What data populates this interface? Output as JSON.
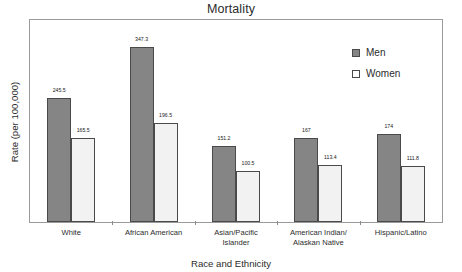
{
  "chart_data": {
    "type": "bar",
    "title": "Mortality",
    "xlabel": "Race and Ethnicity",
    "ylabel": "Rate (per 100,000)",
    "grid": false,
    "legend_position": "upper right",
    "ylim": [
      0,
      400
    ],
    "categories": [
      "White",
      "African American",
      "Asian/Pacific Islander",
      "American Indian/ Alaskan Native",
      "Hispanic/Latino"
    ],
    "category_lines": [
      [
        "White"
      ],
      [
        "African American"
      ],
      [
        "Asian/Pacific",
        "Islander"
      ],
      [
        "American Indian/",
        "Alaskan Native"
      ],
      [
        "Hispanic/Latino"
      ]
    ],
    "series": [
      {
        "name": "Men",
        "color": "#858585",
        "values": [
          245.5,
          347.3,
          151.2,
          167,
          174
        ],
        "labels": [
          "245.5",
          "347.3",
          "151.2",
          "167",
          "174"
        ]
      },
      {
        "name": "Women",
        "color": "#f2f2f2",
        "values": [
          165.5,
          196.5,
          100.5,
          113.4,
          111.8
        ],
        "labels": [
          "165.5",
          "196.5",
          "100.5",
          "113.4",
          "111.8"
        ]
      }
    ]
  },
  "legend": {
    "items": [
      {
        "label": "Men"
      },
      {
        "label": "Women"
      }
    ]
  }
}
